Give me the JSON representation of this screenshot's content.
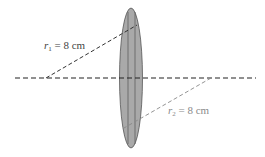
{
  "diagram": {
    "type": "thin-lens",
    "labels": {
      "r1": {
        "var": "r",
        "sub": "1",
        "text": " = 8 cm",
        "color": "#444444"
      },
      "r2": {
        "var": "r",
        "sub": "2",
        "text": " = 8 cm",
        "color": "#8a8a8a"
      }
    },
    "colors": {
      "lens_fill": "#a9a9a9",
      "lens_stroke": "#555555",
      "axis": "#222222",
      "r1_line": "#333333",
      "r2_line": "#888888"
    }
  }
}
